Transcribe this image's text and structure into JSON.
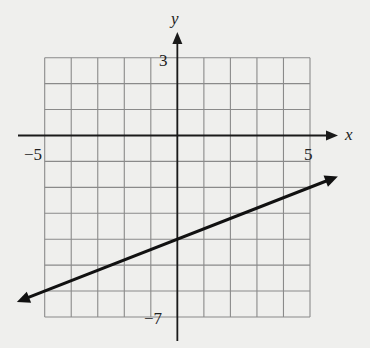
{
  "part_label": ")",
  "chart_data": {
    "type": "line",
    "title": "",
    "xlabel": "x",
    "ylabel": "y",
    "xlim": [
      -5,
      5
    ],
    "ylim": [
      -7,
      3
    ],
    "grid": true,
    "grid_step": 1,
    "tick_labels": {
      "x": [
        {
          "value": -5,
          "label": "−5"
        },
        {
          "value": 5,
          "label": "5"
        }
      ],
      "y": [
        {
          "value": 3,
          "label": "3"
        },
        {
          "value": -7,
          "label": "−7"
        }
      ]
    },
    "series": [
      {
        "name": "line",
        "equation": "y = 0.4x - 4",
        "slope": 0.4,
        "intercept": -4,
        "arrows": "both",
        "x": [
          -5,
          0,
          5
        ],
        "y": [
          -6,
          -4,
          -2
        ]
      }
    ]
  },
  "colors": {
    "background": "#efefed",
    "grid": "#8a8a8a",
    "axis": "#1a1a1a",
    "line": "#111111"
  }
}
